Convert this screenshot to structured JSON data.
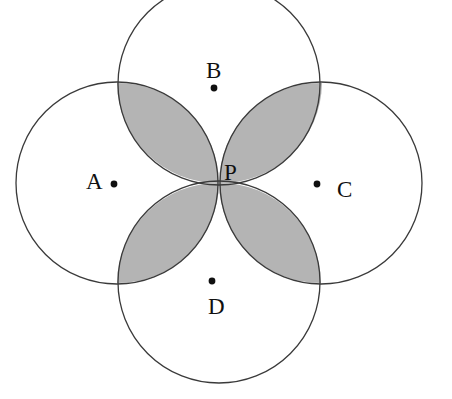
{
  "figure": {
    "background_color": "#ffffff",
    "width": 452,
    "height": 399,
    "stroke_color": "#3a3a3a",
    "stroke_width": 1.3,
    "shade_color": "#b4b4b4",
    "shade_stroke_color": "#3a3a3a",
    "dot_color": "#101010",
    "dot_radius": 3.4,
    "label_color": "#101010",
    "label_font_size": 23,
    "common_point": {
      "name": "P",
      "label": "P",
      "x": 219,
      "y": 183,
      "label_x": 224,
      "label_y": 180,
      "dot_shown": false
    },
    "circles": [
      {
        "name": "circle-a",
        "label": "A",
        "cx": 117,
        "cy": 183,
        "r": 101,
        "label_x": 86,
        "label_y": 189,
        "dot_x": 114,
        "dot_y": 184
      },
      {
        "name": "circle-b",
        "label": "B",
        "cx": 219,
        "cy": 84,
        "r": 101,
        "label_x": 206,
        "label_y": 78,
        "dot_x": 214,
        "dot_y": 88
      },
      {
        "name": "circle-c",
        "label": "C",
        "cx": 321,
        "cy": 183,
        "r": 101,
        "label_x": 337,
        "label_y": 197,
        "dot_x": 317,
        "dot_y": 184
      },
      {
        "name": "circle-d",
        "label": "D",
        "cx": 219,
        "cy": 282,
        "r": 101,
        "label_x": 208,
        "label_y": 314,
        "dot_x": 212,
        "dot_y": 281
      }
    ],
    "lenses": [
      {
        "name": "lens-ab",
        "pair": "A-B",
        "position": "upper-left",
        "tip_x": 117,
        "tip_y": 83,
        "arc_ax": 117,
        "arc_ay": 83,
        "arc_bx": 219,
        "arc_by": 183,
        "r": 101,
        "sweep_one": 0,
        "sweep_two": 0
      },
      {
        "name": "lens-bc",
        "pair": "B-C",
        "position": "upper-right",
        "tip_x": 322,
        "tip_y": 83,
        "arc_ax": 219,
        "arc_ay": 183,
        "arc_bx": 322,
        "arc_by": 83,
        "r": 101,
        "sweep_one": 0,
        "sweep_two": 0
      },
      {
        "name": "lens-ad",
        "pair": "A-D",
        "position": "lower-left",
        "tip_x": 117,
        "tip_y": 283,
        "arc_ax": 219,
        "arc_ay": 183,
        "arc_bx": 117,
        "arc_by": 283,
        "r": 101,
        "sweep_one": 0,
        "sweep_two": 0
      },
      {
        "name": "lens-cd",
        "pair": "C-D",
        "position": "lower-right",
        "tip_x": 321,
        "tip_y": 283,
        "arc_ax": 321,
        "arc_ay": 283,
        "arc_bx": 219,
        "arc_by": 183,
        "r": 101,
        "sweep_one": 0,
        "sweep_two": 0
      }
    ]
  }
}
